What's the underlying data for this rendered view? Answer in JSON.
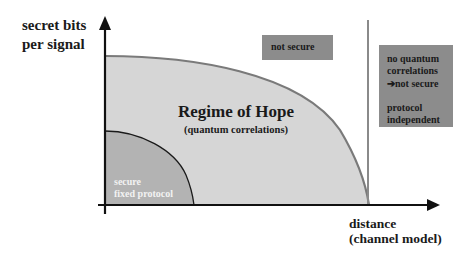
{
  "diagram": {
    "y_axis_label_line1": "secret bits",
    "y_axis_label_line2": "per signal",
    "x_axis_label_line1": "distance",
    "x_axis_label_line2": "(channel model)",
    "regions": {
      "regime": {
        "title": "Regime of Hope",
        "subtitle": "(quantum correlations)",
        "fill": "#d6d6d6",
        "boundary": "#7a7a7a"
      },
      "secure_fixed": {
        "line1": "secure",
        "line2": "fixed protocol",
        "fill": "#b3b3b3",
        "boundary": "#1a1a1a"
      },
      "not_secure": {
        "label": "not secure",
        "fill": "#8c8c8c"
      },
      "no_quantum": {
        "line1": "no quantum",
        "line2": "correlations",
        "line3_arrow": "➔",
        "line3_text": "not secure",
        "line4": "protocol",
        "line5": "independent",
        "fill": "#8c8c8c"
      }
    },
    "colors": {
      "axis": "#111111",
      "divider": "#8a8a8a",
      "background": "#ffffff"
    }
  }
}
